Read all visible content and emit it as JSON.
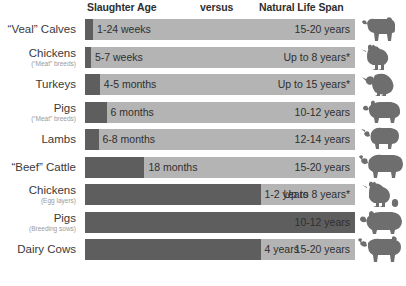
{
  "chart_data": {
    "type": "bar",
    "title": "",
    "columns": [
      "Slaughter Age",
      "versus",
      "Natural Life Span"
    ],
    "xlabel": "",
    "ylabel": "",
    "legend_position": "none",
    "grid": false,
    "note": "Horizontal stacked comparison bars: dark segment = slaughter age, light remainder = natural life span",
    "colors": {
      "slaughter_segment": "#5e5e5e",
      "lifespan_track": "#b4b4b4",
      "text": "#2f2f2f",
      "sub_label": "#9a9a9a",
      "background": "#ffffff"
    },
    "categories": [
      "“Veal” Calves",
      "Chickens (“Meat” breeds)",
      "Turkeys",
      "Pigs (“Meat” breeds)",
      "Lambs",
      "“Beef” Cattle",
      "Chickens (Egg layers)",
      "Pigs (Breeding sows)",
      "Dairy Cows"
    ],
    "series": [
      {
        "name": "Slaughter Age",
        "values": [
          0.46,
          0.12,
          0.38,
          0.5,
          0.58,
          1.5,
          1.5,
          4.0,
          4.0
        ],
        "unit": "years",
        "labels": [
          "1-24 weeks",
          "5-7 weeks",
          "4-5 months",
          "6 months",
          "6-8 months",
          "18 months",
          "1-2 years",
          "3-5 years",
          "4 years"
        ]
      },
      {
        "name": "Natural Life Span",
        "values": [
          17.5,
          8,
          15,
          11,
          13,
          17.5,
          8,
          11,
          17.5
        ],
        "unit": "years",
        "labels": [
          "15-20 years",
          "Up to 8 years*",
          "Up to 15 years*",
          "10-12 years",
          "12-14 years",
          "15-20 years",
          "Up to 8 years*",
          "10-12 years",
          "15-20 years"
        ]
      }
    ]
  },
  "header": {
    "slaughter": "Slaughter Age",
    "versus": "versus",
    "natural": "Natural Life Span"
  },
  "rows": [
    {
      "label": "“Veal” Calves",
      "sublabel": "",
      "slaughter": "1-24 weeks",
      "natural": "15-20 years",
      "fill_pct": 3.0,
      "animal": "calf-silhouette"
    },
    {
      "label": "Chickens",
      "sublabel": "(“Meat” breeds)",
      "slaughter": "5-7 weeks",
      "natural": "Up to 8 years*",
      "fill_pct": 2.2,
      "animal": "chicken-silhouette"
    },
    {
      "label": "Turkeys",
      "sublabel": "",
      "slaughter": "4-5 months",
      "natural": "Up to 15 years*",
      "fill_pct": 5.5,
      "animal": "turkey-silhouette"
    },
    {
      "label": "Pigs",
      "sublabel": "(“Meat” breeds)",
      "slaughter": "6 months",
      "natural": "10-12 years",
      "fill_pct": 8.0,
      "animal": "pig-silhouette"
    },
    {
      "label": "Lambs",
      "sublabel": "",
      "slaughter": "6-8 months",
      "natural": "12-14 years",
      "fill_pct": 5.0,
      "animal": "lamb-silhouette"
    },
    {
      "label": "“Beef” Cattle",
      "sublabel": "",
      "slaughter": "18 months",
      "natural": "15-20 years",
      "fill_pct": 22.0,
      "animal": "cattle-silhouette"
    },
    {
      "label": "Chickens",
      "sublabel": "(Egg layers)",
      "slaughter": "1-2 years",
      "natural": "Up to 8 years*",
      "fill_pct": 65.0,
      "animal": "hen-with-egg-silhouette"
    },
    {
      "label": "Pigs",
      "sublabel": "(Breeding sows)",
      "slaughter": "3-5 years",
      "natural": "10-12 years",
      "fill_pct": 100.0,
      "animal": "sow-silhouette"
    },
    {
      "label": "Dairy Cows",
      "sublabel": "",
      "slaughter": "4 years",
      "natural": "15-20 years",
      "fill_pct": 65.0,
      "animal": "dairy-cow-silhouette"
    }
  ]
}
